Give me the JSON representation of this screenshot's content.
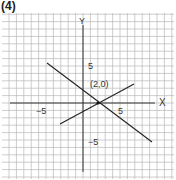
{
  "panel_label": "(4)",
  "axes": {
    "x_label": "X",
    "y_label": "Y",
    "tick_labels": {
      "x_neg5": "−5",
      "x_pos5": "5",
      "y_pos5": "5",
      "y_neg5": "−5"
    }
  },
  "point": {
    "label": "(2,0)",
    "x": 2,
    "y": 0
  },
  "grid": {
    "unit_px": 7.4,
    "origin_px": [
      83,
      103
    ],
    "x_range": [
      -11,
      12
    ],
    "y_range": [
      -10,
      12
    ]
  },
  "lines": [
    {
      "name": "descending-line",
      "from": [
        -4.9,
        5.5
      ],
      "to": [
        9.3,
        -5.3
      ]
    },
    {
      "name": "ascending-line",
      "from": [
        -3.1,
        -2.8
      ],
      "to": [
        6.9,
        2.6
      ]
    }
  ],
  "colors": {
    "grid": "#b8b8b8",
    "axis": "#333333",
    "line": "#222222",
    "background": "#ffffff"
  }
}
